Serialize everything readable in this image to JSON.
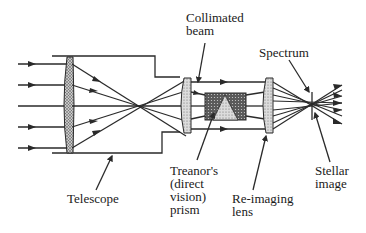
{
  "diagram": {
    "labels": {
      "collimated_beam": "Collimated\nbeam",
      "spectrum": "Spectrum",
      "telescope": "Telescope",
      "treanor_prism": "Treanor's\n(direct\nvision)\nprism",
      "reimaging_lens": "Re-imaging\nlens",
      "stellar_image": "Stellar\nimage"
    },
    "colors": {
      "line": "#2a2a2a",
      "lens_fill": "#a8a8a8",
      "prism_dark": "#555555",
      "prism_light": "#bdbdbd",
      "background": "#ffffff"
    }
  }
}
